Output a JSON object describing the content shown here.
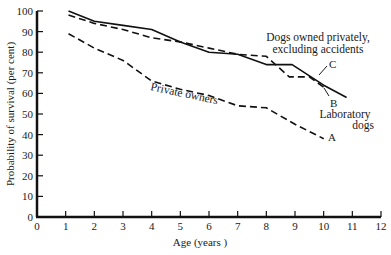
{
  "chart_data": {
    "type": "line",
    "title": "",
    "xlabel": "Age (years )",
    "ylabel": "Probability of survival (per cent)",
    "xlim": [
      0,
      12
    ],
    "ylim": [
      0,
      100
    ],
    "x_ticks": [
      "0",
      "1",
      "2",
      "3",
      "4",
      "5",
      "6",
      "7",
      "8",
      "9",
      "10",
      "11",
      "12"
    ],
    "y_ticks": [
      "0",
      "10",
      "20",
      "30",
      "40",
      "50",
      "60",
      "70",
      "80",
      "90",
      "100"
    ],
    "grid": false,
    "series": [
      {
        "name": "Private owners",
        "marker_label": "A",
        "style": "dashed",
        "x": [
          1.1,
          2,
          3,
          4,
          5,
          6,
          7,
          8,
          9,
          10
        ],
        "y": [
          89,
          82,
          76,
          66,
          62,
          59,
          54,
          53,
          45,
          38
        ]
      },
      {
        "name": "Laboratory dogs",
        "marker_label": "B",
        "style": "solid",
        "x": [
          1.1,
          2,
          3,
          4,
          5,
          6,
          7,
          8,
          8.9,
          10,
          10.8
        ],
        "y": [
          100,
          95,
          93,
          91,
          85,
          80,
          79,
          74,
          74,
          64,
          58
        ]
      },
      {
        "name": "Dogs owned privately, excluding accidents",
        "marker_label": "C",
        "style": "dashed",
        "x": [
          1.1,
          2,
          3,
          4,
          5,
          6,
          7,
          8,
          8.8,
          9.5,
          10
        ],
        "y": [
          98,
          94,
          91,
          87,
          85,
          82,
          79,
          78,
          68,
          68,
          63
        ]
      }
    ],
    "annotations": [
      {
        "text": "Private owners",
        "target": "A"
      },
      {
        "text": "Dogs owned privately,",
        "target": "C"
      },
      {
        "text": "excluding accidents",
        "target": "C"
      },
      {
        "text": "Laboratory",
        "target": "B"
      },
      {
        "text": "dogs",
        "target": "B"
      },
      {
        "text": "A"
      },
      {
        "text": "B"
      },
      {
        "text": "C"
      }
    ]
  },
  "labels": {
    "xlabel": "Age (years )",
    "ylabel": "Probability of survival (per cent)",
    "private_owners": "Private owners",
    "c_line1": "Dogs owned privately,",
    "c_line2": "excluding accidents",
    "b_line1": "Laboratory",
    "b_line2": "dogs",
    "A": "A",
    "B": "B",
    "C": "C"
  }
}
